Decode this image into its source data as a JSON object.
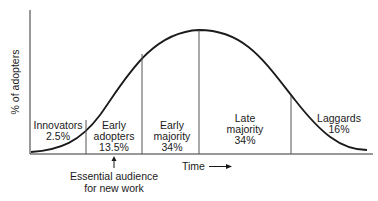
{
  "diagram": {
    "y_axis_label": "% of adopters",
    "x_axis_label": "Time",
    "segments": [
      {
        "name": "Innovators",
        "share": "2.5%"
      },
      {
        "name_line1": "Early",
        "name_line2": "adopters",
        "share": "13.5%"
      },
      {
        "name_line1": "Early",
        "name_line2": "majority",
        "share": "34%"
      },
      {
        "name_line1": "Late",
        "name_line2": "majority",
        "share": "34%"
      },
      {
        "name": "Laggards",
        "share": "16%"
      }
    ],
    "annotation": {
      "line1": "Essential audience",
      "line2": "for new work",
      "points_to": "Early adopters"
    },
    "colors": {
      "ink": "#1a1a1a",
      "divider": "#555555"
    }
  }
}
